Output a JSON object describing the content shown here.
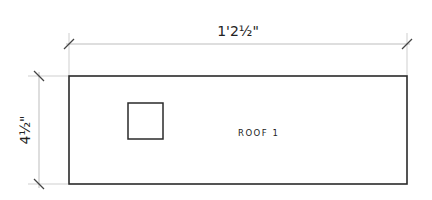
{
  "drawing": {
    "width_dimension": "1'2½\"",
    "height_dimension": "4½\"",
    "panel_label": "ROOF 1",
    "colors": {
      "outline": "#2a2a2a",
      "dimension_line": "#bdbdbd",
      "tick": "#444444",
      "text": "#222222"
    }
  }
}
